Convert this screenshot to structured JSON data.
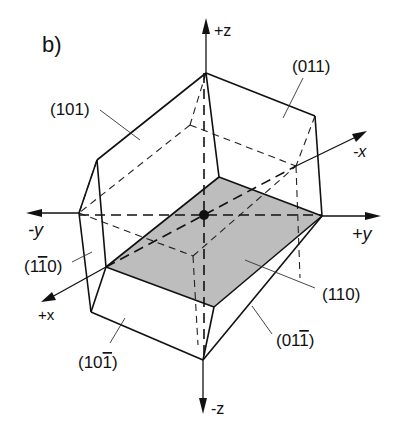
{
  "figure": {
    "panel_label": "b)",
    "colors": {
      "line": "#111111",
      "shaded_plane": "#bdbdbd",
      "background": "#ffffff"
    }
  },
  "axes": {
    "plus_z": "+z",
    "minus_z": "-z",
    "plus_y": "+y",
    "minus_y": "-y",
    "plus_x": "+x",
    "minus_x": "-x"
  },
  "faces": {
    "f101": "(101)",
    "f011": "(011)",
    "f110": "(110)",
    "f1m10_pre": "(1",
    "f1m10_bar": "1",
    "f1m10_post": "0)",
    "f10m1_pre": "(10",
    "f10m1_bar": "1",
    "f10m1_post": ")",
    "f01m1_pre": "(01",
    "f01m1_bar": "1",
    "f01m1_post": ")"
  }
}
